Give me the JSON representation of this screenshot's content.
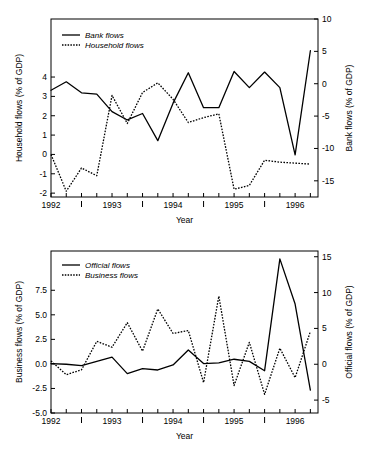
{
  "figure": {
    "background": "#ffffff",
    "ink": "#000000",
    "panel_count": 2
  },
  "chart_data": [
    {
      "id": "top-panel",
      "type": "line",
      "title": "",
      "xlabel": "Year",
      "ylabel": "Household flows (% of GDP)",
      "y2label": "Bank flows (% of GDP)",
      "grid": false,
      "legend_position": "top-left",
      "xlim": [
        1992.0,
        1996.375
      ],
      "xticks_major": [
        1992,
        1993,
        1994,
        1995,
        1996
      ],
      "xticklabels": [
        "1992",
        "1993",
        "1994",
        "1995",
        "1996"
      ],
      "xticks_minor": [
        1992.5,
        1993.5,
        1994.5,
        1995.5
      ],
      "xtick_all": [
        1992.0,
        1992.25,
        1992.5,
        1992.75,
        1993.0,
        1993.25,
        1993.5,
        1993.75,
        1994.0,
        1994.25,
        1994.5,
        1994.75,
        1995.0,
        1995.25,
        1995.5,
        1995.75,
        1996.0,
        1996.25
      ],
      "ylim": [
        -2.2,
        7.0
      ],
      "yticks": [
        4,
        3,
        2,
        1,
        0,
        -1,
        -2
      ],
      "yticklabels": [
        "4",
        "3",
        "2",
        "1",
        "0",
        "-1",
        "-2"
      ],
      "y2lim": [
        -17.5,
        10.0
      ],
      "y2ticks": [
        10,
        5,
        0,
        -5,
        -10,
        -15
      ],
      "y2ticklabels": [
        "10",
        "5",
        "0",
        "-5",
        "-10",
        "-15"
      ],
      "x": [
        1992.0,
        1992.25,
        1992.5,
        1992.75,
        1993.0,
        1993.25,
        1993.5,
        1993.75,
        1994.0,
        1994.25,
        1994.5,
        1994.75,
        1995.0,
        1995.25,
        1995.5,
        1995.75,
        1996.0,
        1996.25
      ],
      "series": [
        {
          "name": "Bank flows",
          "style": "solid",
          "axis": "right",
          "unit": "% of GDP",
          "values": [
            -1.0,
            0.3,
            -1.4,
            -1.6,
            -4.3,
            -5.6,
            -4.6,
            -8.8,
            -3.0,
            1.7,
            -3.7,
            -3.7,
            1.9,
            -0.6,
            1.8,
            -0.6,
            -11.0,
            5.1,
            -0.2
          ]
        },
        {
          "name": "Household flows",
          "style": "dotted",
          "axis": "left",
          "unit": "% of GDP",
          "values": [
            0.0,
            -1.9,
            -0.7,
            -1.1,
            3.05,
            1.6,
            3.2,
            3.7,
            2.85,
            1.65,
            1.9,
            2.1,
            -1.8,
            -1.6,
            -0.3,
            -0.4,
            -0.45,
            -0.5
          ]
        }
      ]
    },
    {
      "id": "bottom-panel",
      "type": "line",
      "title": "",
      "xlabel": "Year",
      "ylabel": "Business flows (% of GDP)",
      "y2label": "Official flows (% of GDP)",
      "grid": false,
      "legend_position": "top-left",
      "xlim": [
        1992.0,
        1996.375
      ],
      "xticks_major": [
        1992,
        1993,
        1994,
        1995,
        1996
      ],
      "xticklabels": [
        "1992",
        "1993",
        "1994",
        "1995",
        "1996"
      ],
      "xticks_minor": [
        1992.5,
        1993.5,
        1994.5,
        1995.5
      ],
      "xtick_all": [
        1992.0,
        1992.25,
        1992.5,
        1992.75,
        1993.0,
        1993.25,
        1993.5,
        1993.75,
        1994.0,
        1994.25,
        1994.5,
        1994.75,
        1995.0,
        1995.25,
        1995.5,
        1995.75,
        1996.0,
        1996.25
      ],
      "ylim": [
        -5.0,
        11.5
      ],
      "yticks": [
        7.5,
        5.0,
        2.5,
        0.0,
        -2.5,
        -5.0
      ],
      "yticklabels": [
        "7.5",
        "5.0",
        "2.5",
        "0.0",
        "-2.5",
        "-5.0"
      ],
      "y2lim": [
        -6.8,
        15.8
      ],
      "y2ticks": [
        15,
        10,
        5,
        0,
        -5
      ],
      "y2ticklabels": [
        "15",
        "10",
        "5",
        "0",
        "-5"
      ],
      "x": [
        1992.0,
        1992.25,
        1992.5,
        1992.75,
        1993.0,
        1993.25,
        1993.5,
        1993.75,
        1994.0,
        1994.25,
        1994.5,
        1994.75,
        1995.0,
        1995.25,
        1995.5,
        1995.75,
        1996.0,
        1996.25
      ],
      "series": [
        {
          "name": "Official flows",
          "style": "solid",
          "axis": "right",
          "unit": "% of GDP",
          "values": [
            0.1,
            0.0,
            -0.2,
            0.4,
            1.0,
            -1.3,
            -0.6,
            -0.8,
            -0.1,
            2.0,
            0.1,
            0.2,
            0.7,
            0.4,
            -0.9,
            14.7,
            8.4,
            -3.6
          ]
        },
        {
          "name": "Business flows",
          "style": "dotted",
          "axis": "left",
          "unit": "% of GDP",
          "values": [
            0.3,
            -1.1,
            -0.6,
            2.3,
            1.7,
            4.2,
            1.3,
            5.6,
            3.1,
            3.4,
            -1.9,
            6.9,
            -2.2,
            2.2,
            -3.1,
            1.6,
            -1.4,
            3.3
          ]
        }
      ]
    }
  ]
}
